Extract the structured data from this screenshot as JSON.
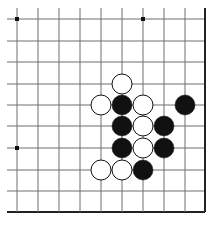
{
  "board": {
    "columns_x": [
      17,
      38,
      59,
      80,
      101,
      122,
      143,
      164,
      185,
      205
    ],
    "rows_y": [
      19,
      41,
      62,
      84,
      105,
      126,
      148,
      170,
      191,
      212
    ],
    "extend_left_to": 7,
    "extend_top_to": 8,
    "right_edge": true,
    "bottom_edge": true,
    "line_color": "#6e6e6e",
    "edge_color": "#222222",
    "stone_radius": 10,
    "star_points": [
      [
        0,
        0
      ],
      [
        6,
        0
      ],
      [
        0,
        6
      ]
    ],
    "stones": [
      {
        "color": "white",
        "col": 5,
        "row": 3
      },
      {
        "color": "white",
        "col": 4,
        "row": 4
      },
      {
        "color": "black",
        "col": 5,
        "row": 4
      },
      {
        "color": "white",
        "col": 6,
        "row": 4
      },
      {
        "color": "black",
        "col": 8,
        "row": 4
      },
      {
        "color": "black",
        "col": 5,
        "row": 5
      },
      {
        "color": "white",
        "col": 6,
        "row": 5
      },
      {
        "color": "black",
        "col": 7,
        "row": 5
      },
      {
        "color": "black",
        "col": 5,
        "row": 6
      },
      {
        "color": "white",
        "col": 6,
        "row": 6
      },
      {
        "color": "black",
        "col": 7,
        "row": 6
      },
      {
        "color": "white",
        "col": 4,
        "row": 7
      },
      {
        "color": "white",
        "col": 5,
        "row": 7
      },
      {
        "color": "black",
        "col": 6,
        "row": 7
      }
    ]
  }
}
